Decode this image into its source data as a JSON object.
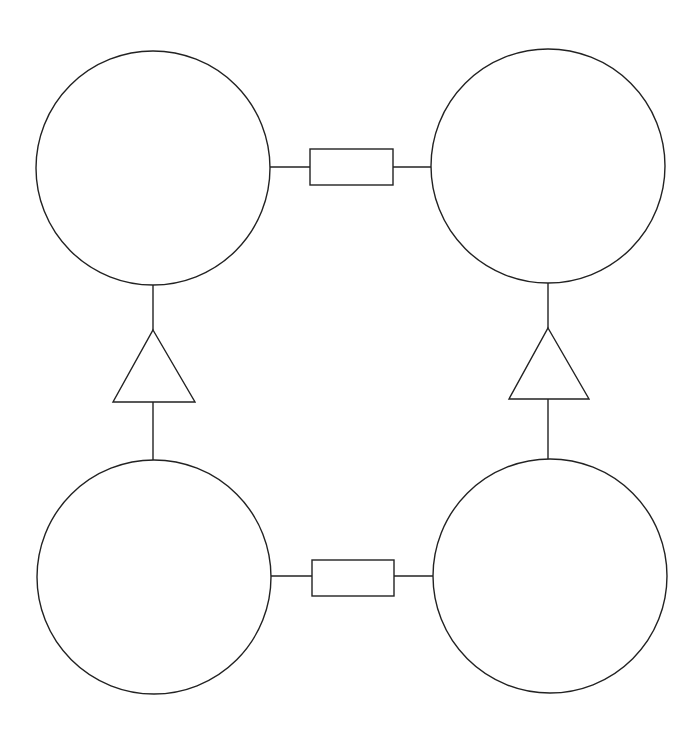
{
  "diagram": {
    "type": "block-diagram",
    "stroke_color": "#222222",
    "background": "#ffffff",
    "nodes": [
      {
        "id": "top-left",
        "shape": "circle",
        "cx": 153,
        "cy": 168,
        "r": 117,
        "label": ""
      },
      {
        "id": "top-right",
        "shape": "circle",
        "cx": 548,
        "cy": 166,
        "r": 117,
        "label": ""
      },
      {
        "id": "bottom-left",
        "shape": "circle",
        "cx": 154,
        "cy": 577,
        "r": 117,
        "label": ""
      },
      {
        "id": "bottom-right",
        "shape": "circle",
        "cx": 550,
        "cy": 576,
        "r": 117,
        "label": ""
      }
    ],
    "connectors": [
      {
        "id": "top-rect",
        "shape": "rectangle",
        "between": [
          "top-left",
          "top-right"
        ],
        "x": 310,
        "y": 149,
        "w": 83,
        "h": 36
      },
      {
        "id": "bottom-rect",
        "shape": "rectangle",
        "between": [
          "bottom-left",
          "bottom-right"
        ],
        "x": 312,
        "y": 560,
        "w": 82,
        "h": 36
      },
      {
        "id": "left-triangle",
        "shape": "triangle",
        "between": [
          "bottom-left",
          "top-left"
        ],
        "apex": [
          153,
          330
        ],
        "base_y": 402,
        "base_x": [
          113,
          195
        ]
      },
      {
        "id": "right-triangle",
        "shape": "triangle",
        "between": [
          "bottom-right",
          "top-right"
        ],
        "apex": [
          548,
          328
        ],
        "base_y": 399,
        "base_x": [
          509,
          589
        ]
      }
    ]
  }
}
